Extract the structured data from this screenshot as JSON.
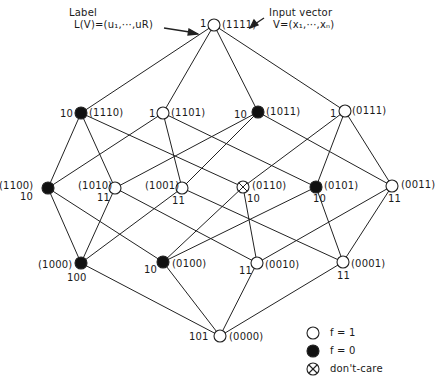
{
  "annotations": {
    "label_title": "Label",
    "label_formula": "L(V)=(u₁,···,uR)",
    "input_title": "Input vector",
    "input_formula": "V=(x₁,···,xₙ)"
  },
  "nodes": [
    {
      "id": "1111",
      "vector": "(1111)",
      "label": "1",
      "state": "f=1",
      "x": 214,
      "y": 25
    },
    {
      "id": "1110",
      "vector": "(1110)",
      "label": "10",
      "state": "f=0",
      "x": 81,
      "y": 113
    },
    {
      "id": "1101",
      "vector": "(1101)",
      "label": "1",
      "state": "f=1",
      "x": 163,
      "y": 113
    },
    {
      "id": "1011",
      "vector": "(1011)",
      "label": "10",
      "state": "f=0",
      "x": 258,
      "y": 112
    },
    {
      "id": "0111",
      "vector": "(0111)",
      "label": "1",
      "state": "f=1",
      "x": 345,
      "y": 111
    },
    {
      "id": "1100",
      "vector": "(1100)",
      "label": "10",
      "state": "f=0",
      "x": 48,
      "y": 188
    },
    {
      "id": "1010",
      "vector": "(1010)",
      "label": "11",
      "state": "f=1",
      "x": 115,
      "y": 188
    },
    {
      "id": "1001",
      "vector": "(1001)",
      "label": "11",
      "state": "f=1",
      "x": 182,
      "y": 188
    },
    {
      "id": "0110",
      "vector": "(0110)",
      "label": "10",
      "state": "dont-care",
      "x": 243,
      "y": 187
    },
    {
      "id": "0101",
      "vector": "(0101)",
      "label": "10",
      "state": "f=0",
      "x": 316,
      "y": 187
    },
    {
      "id": "0011",
      "vector": "(0011)",
      "label": "11",
      "state": "f=1",
      "x": 392,
      "y": 186
    },
    {
      "id": "1000",
      "vector": "(1000)",
      "label": "100",
      "state": "f=0",
      "x": 81,
      "y": 263
    },
    {
      "id": "0100",
      "vector": "(0100)",
      "label": "10",
      "state": "f=0",
      "x": 163,
      "y": 262
    },
    {
      "id": "0010",
      "vector": "(0010)",
      "label": "11",
      "state": "f=1",
      "x": 257,
      "y": 263
    },
    {
      "id": "0001",
      "vector": "(0001)",
      "label": "11",
      "state": "f=1",
      "x": 343,
      "y": 262
    },
    {
      "id": "0000",
      "vector": "(0000)",
      "label": "101",
      "state": "f=1",
      "x": 220,
      "y": 336
    }
  ],
  "legend": [
    {
      "symbol": "open-circle",
      "text": "f = 1"
    },
    {
      "symbol": "filled-circle",
      "text": "f = 0"
    },
    {
      "symbol": "crossed-circle",
      "text": "don't-care"
    }
  ],
  "colors": {
    "line": "#222222",
    "fill_on": "#ffffff",
    "fill_off": "#111111"
  }
}
